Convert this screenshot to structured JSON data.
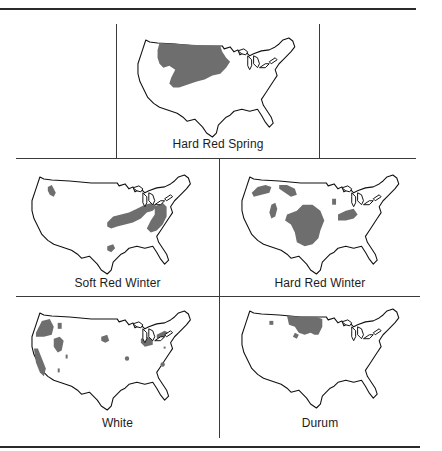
{
  "figure": {
    "panels": [
      {
        "id": "hard-red-spring",
        "label": "Hard Red Spring",
        "regions": [
          "Northern Great Plains (Montana, North Dakota, South Dakota, Minnesota)"
        ]
      },
      {
        "id": "soft-red-winter",
        "label": "Soft Red Winter",
        "regions": [
          "Northern Idaho",
          "Eastern Corn Belt / Ohio Valley",
          "Mid-Atlantic / Southeast",
          "East Texas"
        ]
      },
      {
        "id": "hard-red-winter",
        "label": "Hard Red Winter",
        "regions": [
          "Montana",
          "North Dakota/Montana border",
          "Idaho/Utah",
          "Central & Southern Plains",
          "Michigan",
          "Ohio/Indiana"
        ]
      },
      {
        "id": "white",
        "label": "White",
        "regions": [
          "Pacific Northwest",
          "California",
          "Idaho",
          "Utah",
          "Nebraska",
          "Michigan",
          "New York",
          "Kentucky",
          "Oklahoma",
          "Georgia"
        ]
      },
      {
        "id": "durum",
        "label": "Durum",
        "regions": [
          "North Dakota",
          "Montana",
          "South Dakota"
        ]
      }
    ],
    "colors": {
      "region_fill": "#6e6e6e",
      "outline": "#111111",
      "rules": "#2a2a2a"
    }
  }
}
